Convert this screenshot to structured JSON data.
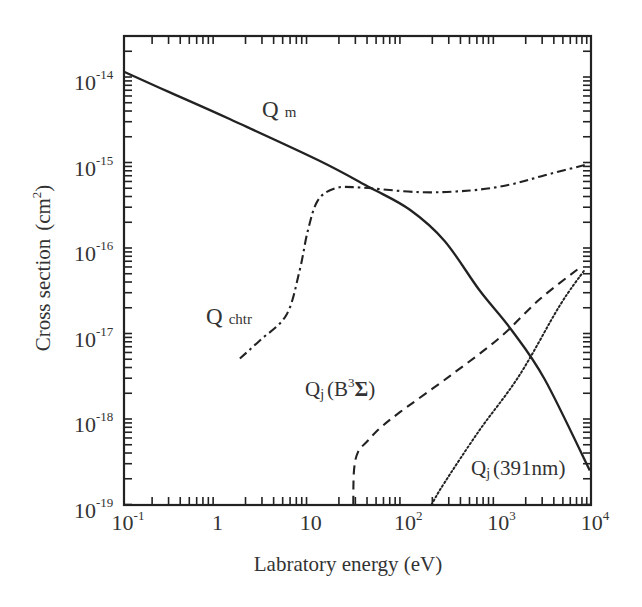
{
  "chart_data": {
    "type": "line",
    "title": "",
    "xlabel": "Labratory energy (eV)",
    "ylabel": "Cross section (cm^2)",
    "xscale": "log",
    "yscale": "log",
    "xlim": [
      0.1,
      10000
    ],
    "ylim": [
      1e-19,
      3e-14
    ],
    "grid": false,
    "legend": "none (inline curve labels)",
    "x_tick_labels": [
      {
        "value": 0.1,
        "base": "10",
        "exp": "-1"
      },
      {
        "value": 1,
        "base": "1",
        "exp": ""
      },
      {
        "value": 10,
        "base": "10",
        "exp": ""
      },
      {
        "value": 100,
        "base": "10",
        "exp": "2"
      },
      {
        "value": 1000,
        "base": "10",
        "exp": "3"
      },
      {
        "value": 10000,
        "base": "10",
        "exp": "4"
      }
    ],
    "y_tick_labels": [
      {
        "value": 1e-14,
        "base": "10",
        "exp": "-14"
      },
      {
        "value": 1e-15,
        "base": "10",
        "exp": "-15"
      },
      {
        "value": 1e-16,
        "base": "10",
        "exp": "-16"
      },
      {
        "value": 1e-17,
        "base": "10",
        "exp": "-17"
      },
      {
        "value": 1e-18,
        "base": "10",
        "exp": "-18"
      },
      {
        "value": 1e-19,
        "base": "10",
        "exp": "-19"
      }
    ],
    "series": [
      {
        "name": "Q_m",
        "label_main": "Q",
        "label_sub": "m",
        "style": "solid",
        "x": [
          0.1,
          0.31,
          1.37,
          11.9,
          43,
          115,
          272,
          640,
          1410,
          3200,
          9700
        ],
        "y": [
          1.15e-14,
          6.6e-15,
          3.2e-15,
          1.07e-15,
          5.1e-16,
          2.8e-16,
          1.2e-16,
          3.2e-17,
          1.1e-17,
          2.9e-18,
          2.5e-19
        ]
      },
      {
        "name": "Q_chtr",
        "label_main": "Q",
        "label_sub": "chtr",
        "style": "dashdot",
        "x": [
          1.74,
          2.85,
          5.5,
          7.6,
          9.3,
          11.9,
          18.3,
          33.5,
          146,
          506,
          1350,
          3200,
          9400
        ],
        "y": [
          5.1e-18,
          8.3e-18,
          1.66e-17,
          5.5e-17,
          1.6e-16,
          3.6e-16,
          5e-16,
          5.1e-16,
          4.5e-16,
          4.7e-16,
          5.5e-16,
          7.1e-16,
          9.6e-16
        ]
      },
      {
        "name": "Q_j(B^3 Sigma)",
        "label_main": "Q",
        "label_sub": "j",
        "label_rest": "(B",
        "label_sup": "3",
        "label_tail": "Σ)",
        "style": "dashed",
        "x": [
          28.5,
          29,
          32,
          41,
          55,
          90,
          310,
          1050,
          2800,
          7600
        ],
        "y": [
          1e-19,
          2.5e-19,
          4.1e-19,
          5.6e-19,
          7.8e-19,
          1.2e-18,
          3.2e-18,
          8.9e-18,
          2.5e-17,
          5.9e-17
        ]
      },
      {
        "name": "Q_j(391nm)",
        "label_main": "Q",
        "label_sub": "j",
        "label_rest": "(391nm)",
        "style": "dotted",
        "x": [
          196,
          270,
          640,
          1700,
          4600,
          8500
        ],
        "y": [
          1e-19,
          1.8e-19,
          7.4e-19,
          3.2e-18,
          2.1e-17,
          5.5e-17
        ]
      }
    ],
    "annotations": [
      {
        "text": "Q m",
        "series": "Q_m",
        "x_px": 262,
        "y_px": 117
      },
      {
        "text": "Q chtr",
        "series": "Q_chtr",
        "x_px": 206,
        "y_px": 324
      },
      {
        "text": "Qj(B3Σ)",
        "series": "Q_j(B^3 Sigma)",
        "x_px": 305,
        "y_px": 396
      },
      {
        "text": "Qj(391nm)",
        "series": "Q_j(391nm)",
        "x_px": 471,
        "y_px": 475
      }
    ]
  },
  "axes": {
    "xlabel": "Labratory energy (eV)",
    "ylabel_main": "Cross section",
    "ylabel_unit_open": "(cm",
    "ylabel_unit_sup": "2",
    "ylabel_unit_close": ")"
  },
  "colors": {
    "line": "#222222",
    "axis": "#222222",
    "text": "#333333",
    "background": "#ffffff"
  }
}
